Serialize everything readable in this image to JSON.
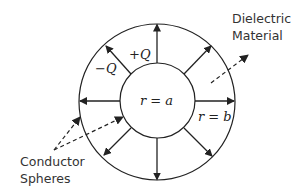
{
  "diagram": {
    "type": "spherical capacitor cross-section",
    "labels": {
      "dielectric_line1": "Dielectric",
      "dielectric_line2": "Material",
      "conductor_line1": "Conductor",
      "conductor_line2": "Spheres",
      "plus_q": "+Q",
      "minus_q": "−Q",
      "inner_radius": "r = a",
      "outer_radius": "r = b"
    },
    "geometry": {
      "center": [
        157,
        101
      ],
      "inner_radius_px": 37,
      "outer_radius_px": 78,
      "field_arrow_count": 8
    },
    "colors": {
      "line": "#222222",
      "text": "#333333",
      "background": "#ffffff"
    }
  }
}
